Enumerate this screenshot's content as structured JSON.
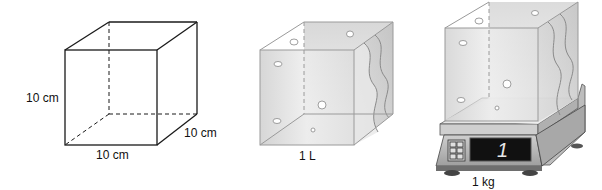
{
  "figures": [
    {
      "id": "cube-outline",
      "labels": {
        "height": "10 cm",
        "width": "10 cm",
        "depth": "10 cm"
      }
    },
    {
      "id": "water-cube",
      "labels": {
        "volume": "1 L"
      }
    },
    {
      "id": "cube-on-scale",
      "labels": {
        "mass": "1 kg"
      },
      "scale_display": "1"
    }
  ],
  "colors": {
    "line": "#1a1a1a",
    "glass_edge": "#9a9a9a",
    "water_light": "#eeeeee",
    "water_dark": "#bdbdbd",
    "scale_body": "#b5b5b5",
    "display_bg": "#111111"
  }
}
